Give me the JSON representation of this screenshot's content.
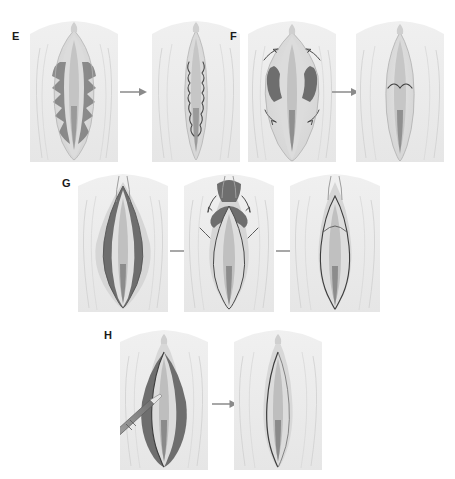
{
  "figure": {
    "type": "surgical-technique-illustration",
    "background_color": "#ffffff",
    "panel_background_color": "#ebebeb",
    "skin_tone_color": "#dcdcdc",
    "marked_tissue_color": "#6e6e6e",
    "inner_tissue_color": "#c9c9c9",
    "outline_color": "#3a3a3a",
    "arrow_color": "#8a8a8a",
    "instrument_color": "#808080",
    "label_color": "#1a1a1a"
  },
  "panels": [
    {
      "id": "E",
      "label": "E",
      "label_x": 12,
      "label_y": 31,
      "technique": "W-plasty / zigzag wedge resection",
      "steps": [
        {
          "name": "pre-operative-marking",
          "description": "bilateral zigzag W-shaped excision markings on labia minora",
          "x": 30,
          "y": 18,
          "width": 88,
          "height": 144,
          "marking": "zigzag",
          "instrument": false
        },
        {
          "name": "post-operative-result",
          "description": "closed zigzag suture line after W-plasty",
          "x": 152,
          "y": 18,
          "width": 88,
          "height": 144,
          "marking": "suture-zigzag",
          "instrument": false
        }
      ],
      "arrows": [
        {
          "name": "step-arrow",
          "x": 120,
          "y": 86,
          "width": 28,
          "height": 12
        }
      ]
    },
    {
      "id": "F",
      "label": "F",
      "label_x": 230,
      "label_y": 31,
      "technique": "superior pedicle flap / de-epithelialization",
      "steps": [
        {
          "name": "pre-operative-marking",
          "description": "bilateral wedge-shaped excision zones with mobilization arrows",
          "x": 248,
          "y": 18,
          "width": 88,
          "height": 144,
          "marking": "wedge-pair",
          "instrument": false
        },
        {
          "name": "post-operative-result",
          "description": "transverse suture line after wedge closure",
          "x": 356,
          "y": 18,
          "width": 88,
          "height": 144,
          "marking": "suture-transverse",
          "instrument": false
        }
      ],
      "arrows": [
        {
          "name": "step-arrow",
          "x": 332,
          "y": 86,
          "width": 28,
          "height": 12
        }
      ]
    },
    {
      "id": "G",
      "label": "G",
      "label_x": 62,
      "label_y": 178,
      "technique": "central wedge resection with flap advancement",
      "steps": [
        {
          "name": "pre-operative-marking",
          "description": "broad bilateral labial hypertrophy marked for resection",
          "x": 78,
          "y": 172,
          "width": 90,
          "height": 140,
          "marking": "broad-wedge",
          "instrument": false
        },
        {
          "name": "intra-operative-mobilization",
          "description": "flap elevation and advancement with directional arrows",
          "x": 184,
          "y": 172,
          "width": 90,
          "height": 140,
          "marking": "flap-advance",
          "instrument": false
        },
        {
          "name": "post-operative-result",
          "description": "final closure with reduced labial contour",
          "x": 290,
          "y": 172,
          "width": 90,
          "height": 140,
          "marking": "closed-contour",
          "instrument": false
        }
      ],
      "arrows": [
        {
          "name": "step-arrow-1",
          "x": 170,
          "y": 245,
          "width": 26,
          "height": 12
        },
        {
          "name": "step-arrow-2",
          "x": 276,
          "y": 245,
          "width": 26,
          "height": 12
        }
      ]
    },
    {
      "id": "H",
      "label": "H",
      "label_x": 104,
      "label_y": 330,
      "technique": "linear trim / edge resection with electrocautery",
      "steps": [
        {
          "name": "intra-operative-resection",
          "description": "linear amputation of labial edge using handheld cautery device",
          "x": 120,
          "y": 328,
          "width": 88,
          "height": 142,
          "marking": "linear-trim",
          "instrument": true,
          "instrument_name": "electrocautery-pen"
        },
        {
          "name": "post-operative-result",
          "description": "linear suture line after trim resection",
          "x": 234,
          "y": 328,
          "width": 88,
          "height": 142,
          "marking": "suture-linear",
          "instrument": false
        }
      ],
      "arrows": [
        {
          "name": "step-arrow",
          "x": 212,
          "y": 398,
          "width": 26,
          "height": 12
        }
      ]
    }
  ]
}
